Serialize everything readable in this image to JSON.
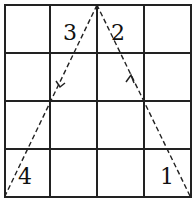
{
  "diagram": {
    "type": "grid-path",
    "grid": {
      "rows": 4,
      "cols": 4
    },
    "labels": [
      {
        "text": "3",
        "row": 0,
        "col": 1
      },
      {
        "text": "2",
        "row": 0,
        "col": 2
      },
      {
        "text": "4",
        "row": 3,
        "col": 0
      },
      {
        "text": "1",
        "row": 3,
        "col": 3
      }
    ],
    "path": {
      "style": "dashed",
      "description": "Path from bottom-right corner up to top-center apex, then down to bottom-left corner, with direction arrows",
      "points": [
        "bottom-right",
        "top-center",
        "bottom-left"
      ]
    },
    "colors": {
      "line": "#222222",
      "background": "#ffffff"
    }
  }
}
